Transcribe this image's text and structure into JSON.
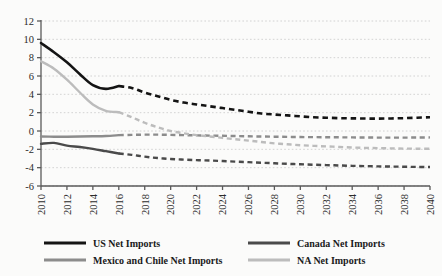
{
  "chart_data": {
    "type": "line",
    "title": "",
    "xlabel": "",
    "ylabel": "",
    "xlim": [
      2010,
      2040
    ],
    "ylim": [
      -6,
      12
    ],
    "grid": true,
    "legend_position": "bottom",
    "y_ticks": [
      "12",
      "10",
      "8",
      "6",
      "4",
      "2",
      "0",
      "-2",
      "-4",
      "-6"
    ],
    "y_tick_values": [
      12,
      10,
      8,
      6,
      4,
      2,
      0,
      -2,
      -4,
      -6
    ],
    "x_ticks": [
      "2010",
      "2012",
      "2014",
      "2016",
      "2018",
      "2020",
      "2022",
      "2024",
      "2026",
      "2028",
      "2030",
      "2032",
      "2034",
      "2036",
      "2038",
      "2040"
    ],
    "x_tick_values": [
      2010,
      2012,
      2014,
      2016,
      2018,
      2020,
      2022,
      2024,
      2026,
      2028,
      2030,
      2032,
      2034,
      2036,
      2038,
      2040
    ],
    "history_forecast_split": 2016.5,
    "x": [
      2010,
      2011,
      2012,
      2013,
      2014,
      2015,
      2016,
      2017,
      2018,
      2019,
      2020,
      2021,
      2022,
      2023,
      2024,
      2025,
      2026,
      2027,
      2028,
      2029,
      2030,
      2031,
      2032,
      2033,
      2034,
      2035,
      2036,
      2037,
      2038,
      2039,
      2040
    ],
    "series": [
      {
        "name": "US Net Imports",
        "color": "#141414",
        "width": 2.6,
        "values": [
          9.6,
          8.6,
          7.5,
          6.2,
          5.0,
          4.6,
          4.9,
          4.7,
          4.2,
          3.8,
          3.4,
          3.1,
          2.9,
          2.7,
          2.5,
          2.3,
          2.1,
          1.9,
          1.8,
          1.7,
          1.6,
          1.5,
          1.45,
          1.4,
          1.38,
          1.36,
          1.35,
          1.37,
          1.4,
          1.45,
          1.5
        ]
      },
      {
        "name": "Canada Net Imports",
        "color": "#4a4a4a",
        "width": 2.4,
        "values": [
          -1.4,
          -1.3,
          -1.6,
          -1.75,
          -1.95,
          -2.2,
          -2.45,
          -2.6,
          -2.8,
          -2.95,
          -3.05,
          -3.12,
          -3.18,
          -3.22,
          -3.28,
          -3.34,
          -3.4,
          -3.46,
          -3.52,
          -3.58,
          -3.63,
          -3.68,
          -3.72,
          -3.76,
          -3.8,
          -3.83,
          -3.86,
          -3.88,
          -3.9,
          -3.92,
          -3.93
        ]
      },
      {
        "name": "Mexico and Chile Net Imports",
        "color": "#8c8c8c",
        "width": 2.4,
        "values": [
          -0.6,
          -0.62,
          -0.62,
          -0.6,
          -0.58,
          -0.55,
          -0.45,
          -0.42,
          -0.4,
          -0.4,
          -0.42,
          -0.45,
          -0.48,
          -0.5,
          -0.52,
          -0.55,
          -0.58,
          -0.6,
          -0.62,
          -0.64,
          -0.66,
          -0.67,
          -0.68,
          -0.69,
          -0.7,
          -0.71,
          -0.72,
          -0.72,
          -0.72,
          -0.71,
          -0.7
        ]
      },
      {
        "name": "NA Net Imports",
        "color": "#bcbcbc",
        "width": 2.4,
        "values": [
          7.6,
          6.8,
          5.6,
          4.2,
          2.9,
          2.2,
          2.05,
          1.5,
          0.9,
          0.4,
          0.0,
          -0.25,
          -0.45,
          -0.6,
          -0.75,
          -0.9,
          -1.05,
          -1.2,
          -1.35,
          -1.45,
          -1.55,
          -1.62,
          -1.68,
          -1.74,
          -1.8,
          -1.84,
          -1.87,
          -1.9,
          -1.92,
          -1.93,
          -1.94
        ]
      }
    ]
  },
  "legend": {
    "items": [
      {
        "label": "US Net Imports",
        "color": "#141414"
      },
      {
        "label": "Canada Net Imports",
        "color": "#4a4a4a"
      },
      {
        "label": "Mexico and Chile Net Imports",
        "color": "#8c8c8c"
      },
      {
        "label": "NA Net Imports",
        "color": "#bcbcbc"
      }
    ]
  },
  "style": {
    "background": "#fbfbfa",
    "axis_color": "#5a5a5a",
    "grid_color": "#c9c9c9"
  }
}
